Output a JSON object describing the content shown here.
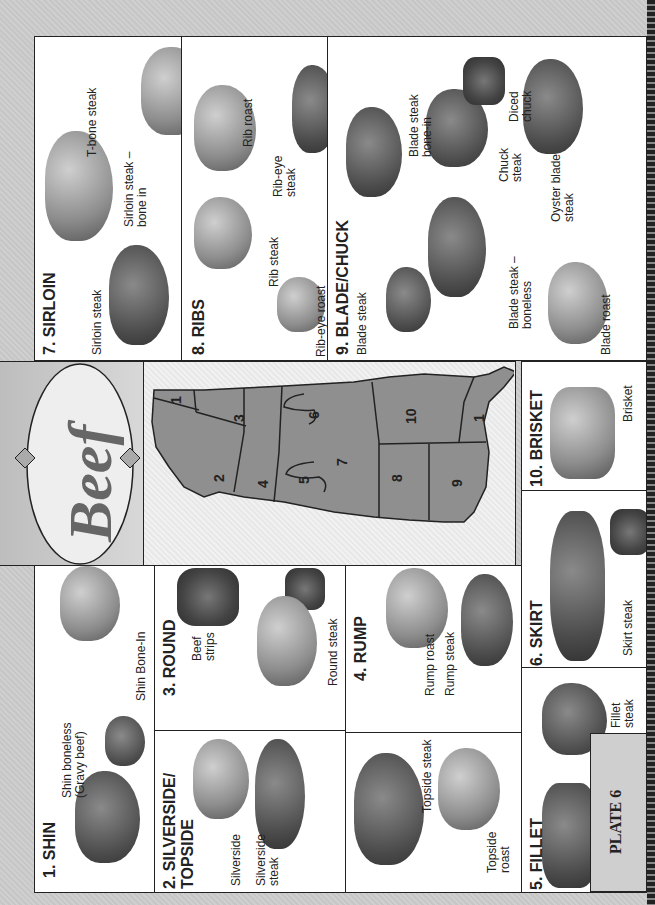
{
  "title": "Beef",
  "plate_label": "PLATE 6",
  "colors": {
    "diagram_fill": "#8f8f8f",
    "outline": "#222222",
    "panel_bg": "#ffffff",
    "page_bg": "#c9c9c9"
  },
  "sections": [
    {
      "id": 1,
      "heading": "1. SHIN",
      "cuts": [
        "Shin boneless (Gravy beef)",
        "Shin Bone-In"
      ]
    },
    {
      "id": 2,
      "heading": "2. SILVERSIDE/ TOPSIDE",
      "cuts": [
        "Silverside",
        "Silverside steak",
        "Topside steak",
        "Topside roast"
      ]
    },
    {
      "id": 3,
      "heading": "3. ROUND",
      "cuts": [
        "Beef strips",
        "Round steak"
      ]
    },
    {
      "id": 4,
      "heading": "4. RUMP",
      "cuts": [
        "Rump roast",
        "Rump steak"
      ]
    },
    {
      "id": 5,
      "heading": "5. FILLET",
      "cuts": [
        "Eye fillet",
        "Fillet steak"
      ]
    },
    {
      "id": 6,
      "heading": "6. SKIRT",
      "cuts": [
        "Skirt steak"
      ]
    },
    {
      "id": 7,
      "heading": "7. SIRLOIN",
      "cuts": [
        "Sirloin steak",
        "Sirloin steak – bone in",
        "T-bone steak"
      ]
    },
    {
      "id": 8,
      "heading": "8. RIBS",
      "cuts": [
        "Rib-eye roast",
        "Rib steak",
        "Rib roast",
        "Rib-eye steak"
      ]
    },
    {
      "id": 9,
      "heading": "9. BLADE/CHUCK",
      "cuts": [
        "Blade steak",
        "Blade roast",
        "Blade steak – boneless",
        "Blade steak bone-in",
        "Chuck steak",
        "Diced chuck",
        "Oyster blade steak"
      ]
    },
    {
      "id": 10,
      "heading": "10. BRISKET",
      "cuts": [
        "Brisket"
      ]
    }
  ],
  "diagram_regions": [
    "1",
    "2",
    "3",
    "4",
    "5",
    "6",
    "7",
    "8",
    "9",
    "10",
    "1"
  ],
  "labels": {
    "shin_boneless_1": "Shin boneless",
    "shin_boneless_2": "(Gravy beef)",
    "silverside_1": "Silverside",
    "silverside_2": "steak",
    "topside_roast_1": "Topside",
    "topside_roast_2": "roast",
    "beef_strips_1": "Beef",
    "beef_strips_2": "strips",
    "fillet_steak_1": "Fillet",
    "fillet_steak_2": "steak",
    "sirloin_bone_1": "Sirloin steak –",
    "sirloin_bone_2": "bone in",
    "ribeye_steak_1": "Rib-eye",
    "ribeye_steak_2": "steak",
    "blade_bone_1": "Blade steak",
    "blade_bone_2": "bone-in",
    "chuck_1": "Chuck",
    "chuck_2": "steak",
    "diced_1": "Diced",
    "diced_2": "chuck",
    "oyster_1": "Oyster blade",
    "oyster_2": "steak",
    "blade_boneless_1": "Blade steak –",
    "blade_boneless_2": "boneless",
    "silverside_h1": "2. SILVERSIDE/",
    "silverside_h2": "TOPSIDE"
  }
}
